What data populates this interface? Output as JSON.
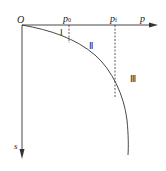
{
  "diagram": {
    "origin_label": "O",
    "x_axis_label": "p",
    "y_axis_label": "s",
    "markers": [
      {
        "base": "p",
        "sub": "0"
      },
      {
        "base": "p",
        "sub": "f"
      }
    ],
    "regions": [
      "Ⅰ",
      "Ⅱ",
      "Ⅲ"
    ],
    "colors": {
      "line": "#333333",
      "text": "#222222",
      "background": "#ffffff"
    }
  }
}
